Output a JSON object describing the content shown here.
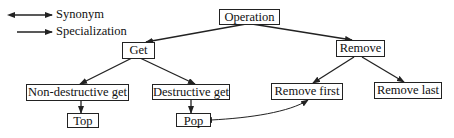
{
  "legend": {
    "items": [
      {
        "label": "Synonym",
        "icon": "double-arrow-icon"
      },
      {
        "label": "Specialization",
        "icon": "single-arrow-icon"
      }
    ]
  },
  "nodes": {
    "operation": {
      "label": "Operation"
    },
    "get": {
      "label": "Get"
    },
    "remove": {
      "label": "Remove"
    },
    "non_destructive_get": {
      "label": "Non-destructive get"
    },
    "destructive_get": {
      "label": "Destructive get"
    },
    "remove_first": {
      "label": "Remove first"
    },
    "remove_last": {
      "label": "Remove last"
    },
    "top": {
      "label": "Top"
    },
    "pop": {
      "label": "Pop"
    }
  },
  "edges": [
    {
      "from": "Operation",
      "to": "Get",
      "type": "specialization"
    },
    {
      "from": "Operation",
      "to": "Remove",
      "type": "specialization"
    },
    {
      "from": "Get",
      "to": "Non-destructive get",
      "type": "specialization"
    },
    {
      "from": "Get",
      "to": "Destructive get",
      "type": "specialization"
    },
    {
      "from": "Remove",
      "to": "Remove first",
      "type": "specialization"
    },
    {
      "from": "Remove",
      "to": "Remove last",
      "type": "specialization"
    },
    {
      "from": "Non-destructive get",
      "to": "Top",
      "type": "specialization"
    },
    {
      "from": "Destructive get",
      "to": "Pop",
      "type": "specialization"
    },
    {
      "from": "Pop",
      "to": "Remove first",
      "type": "synonym"
    }
  ]
}
